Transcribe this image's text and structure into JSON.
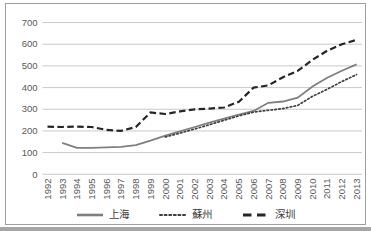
{
  "chart_data": {
    "type": "line",
    "title": "",
    "xlabel": "",
    "ylabel": "",
    "x": [
      1992,
      1993,
      1994,
      1995,
      1996,
      1997,
      1998,
      1999,
      2000,
      2001,
      2002,
      2003,
      2004,
      2005,
      2006,
      2007,
      2008,
      2009,
      2010,
      2011,
      2012,
      2013
    ],
    "series": [
      {
        "key": "shanghai",
        "name": "上海",
        "style": "solid",
        "color": "#7f7f7f",
        "values": [
          null,
          145,
          122,
          122,
          124,
          127,
          134,
          155,
          178,
          198,
          218,
          238,
          257,
          276,
          292,
          330,
          336,
          354,
          405,
          445,
          478,
          507
        ]
      },
      {
        "key": "suzhou",
        "name": "蘇州",
        "style": "dotted",
        "color": "#3f3f3f",
        "values": [
          null,
          null,
          null,
          null,
          null,
          null,
          null,
          null,
          172,
          190,
          209,
          229,
          249,
          270,
          287,
          295,
          303,
          318,
          360,
          392,
          428,
          460
        ]
      },
      {
        "key": "shenzhen",
        "name": "深圳",
        "style": "dashed",
        "color": "#262626",
        "values": [
          220,
          218,
          220,
          218,
          205,
          200,
          218,
          285,
          278,
          290,
          300,
          303,
          308,
          335,
          400,
          410,
          448,
          477,
          528,
          570,
          600,
          620
        ]
      }
    ],
    "ylim": [
      0,
      700
    ],
    "ytick_step": 100,
    "ytick_labels": [
      "0",
      "100",
      "200",
      "300",
      "400",
      "500",
      "600",
      "700"
    ],
    "grid": true,
    "gridline_color": "#c3c3c3",
    "legend_position": "bottom",
    "frame_border_color": "#9e9e9e",
    "tick_label_color": "#595959"
  }
}
